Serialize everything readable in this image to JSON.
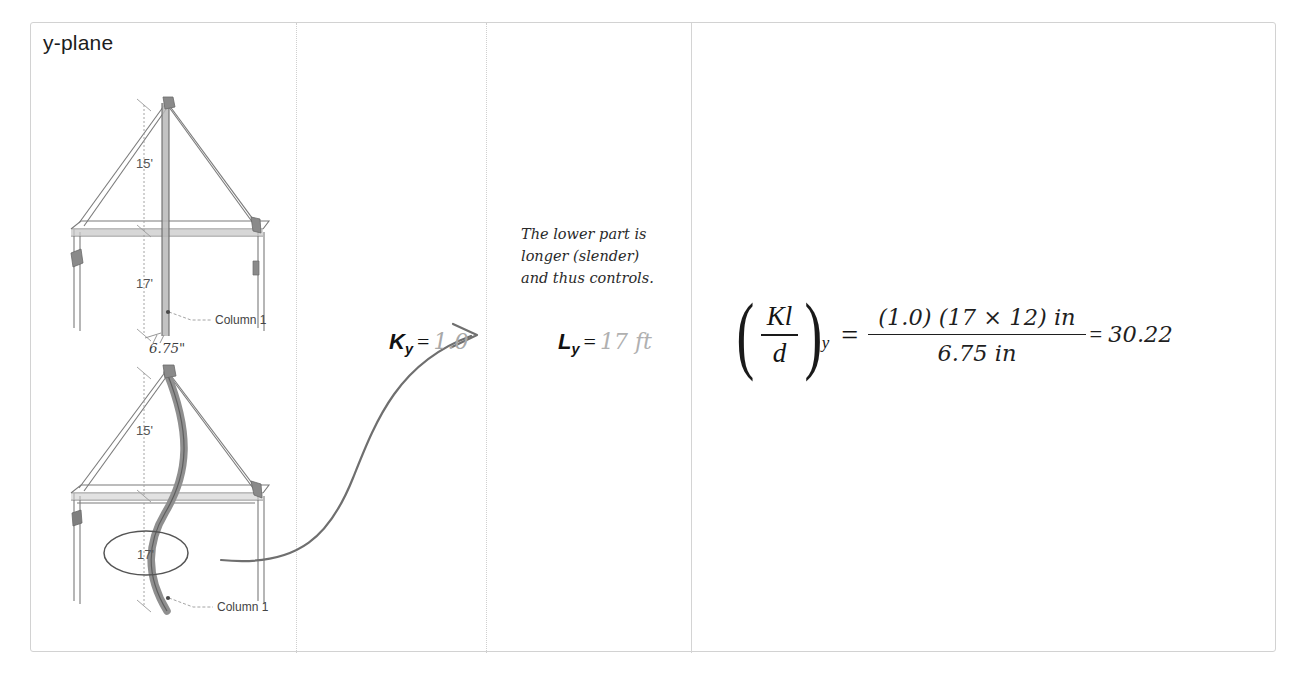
{
  "panel": {
    "title": "y-plane"
  },
  "diagrams": [
    {
      "name": "straight-column-truss",
      "dim_upper": "15'",
      "dim_lower": "17'",
      "width_label": "6.75\"",
      "member_label": "Column 1"
    },
    {
      "name": "buckled-column-truss",
      "dim_upper": "15'",
      "dim_lower": "17'",
      "member_label": "Column 1",
      "highlight": "17'"
    }
  ],
  "note": {
    "line1": "The lower part is",
    "line2": "longer (slender)",
    "line3": "and thus controls."
  },
  "k_factor": {
    "symbol": "K",
    "subscript": "y",
    "equals": "=",
    "value": "1.0"
  },
  "length": {
    "symbol": "L",
    "subscript": "y",
    "equals": "=",
    "value": "17 ft"
  },
  "equation": {
    "lhs_num": "Kl",
    "lhs_den": "d",
    "lhs_sub": "y",
    "equals": "=",
    "numerator": "(1.0) (17 × 12) in",
    "denominator": "6.75 in",
    "result_equals": "=",
    "result": "30.22"
  },
  "colors": {
    "frame_border": "#d2d2d2",
    "divider": "#cfcfcf",
    "ink": "#1f1f1f",
    "faded_ink": "#a8a8a8",
    "sketch": "#6e6e6e"
  }
}
